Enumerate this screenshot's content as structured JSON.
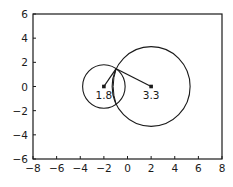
{
  "chart_data": {
    "type": "scatter",
    "title": "",
    "xlabel": "",
    "ylabel": "",
    "xlim": [
      -8,
      8
    ],
    "ylim": [
      -6,
      6
    ],
    "grid": false,
    "legend": null,
    "x_ticks": [
      -8,
      -6,
      -4,
      -2,
      0,
      2,
      4,
      6,
      8
    ],
    "y_ticks": [
      -6,
      -4,
      -2,
      0,
      2,
      4,
      6
    ],
    "x_tick_labels": [
      "−8",
      "−6",
      "−4",
      "−2",
      "0",
      "2",
      "4",
      "6",
      "8"
    ],
    "y_tick_labels": [
      "−6",
      "−4",
      "−2",
      "0",
      "2",
      "4",
      "6"
    ],
    "circles": [
      {
        "name": "small-circle",
        "center": [
          -2,
          0
        ],
        "radius": 1.8,
        "label": "1.8"
      },
      {
        "name": "large-circle",
        "center": [
          2,
          0
        ],
        "radius": 3.3,
        "label": "3.3"
      }
    ],
    "intersection_point": [
      -0.96,
      1.47
    ],
    "segments": [
      {
        "from": [
          -2,
          0
        ],
        "to": [
          -0.96,
          1.47
        ]
      },
      {
        "from": [
          2,
          0
        ],
        "to": [
          -0.96,
          1.47
        ]
      }
    ],
    "annotations": [
      "1.8",
      "3.3"
    ],
    "colors": {
      "line": "#1a1a1a",
      "frame": "#1a1a1a",
      "background": "#ffffff"
    }
  }
}
